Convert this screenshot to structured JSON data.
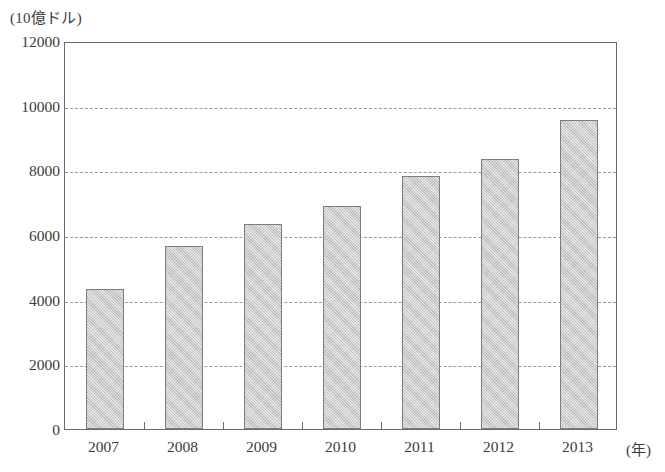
{
  "chart_data": {
    "type": "bar",
    "title": "",
    "subtitle": "",
    "xlabel": "(年)",
    "ylabel": "(10億ドル)",
    "categories": [
      "2007",
      "2008",
      "2009",
      "2010",
      "2011",
      "2012",
      "2013"
    ],
    "values": [
      4330,
      5650,
      6350,
      6900,
      7830,
      8350,
      9550
    ],
    "series": [
      {
        "name": "",
        "values": [
          4330,
          5650,
          6350,
          6900,
          7830,
          8350,
          9550
        ]
      }
    ],
    "ylim": [
      0,
      12000
    ],
    "y_ticks": [
      0,
      2000,
      4000,
      6000,
      8000,
      10000,
      12000
    ],
    "y_tick_labels": [
      "0",
      "2000",
      "4000",
      "6000",
      "8000",
      "10000",
      "12000"
    ],
    "grid": "horizontal-dashed",
    "legend": "none",
    "bar_fill_color": "#c9c9c9",
    "bar_border_color": "#7d7d7d",
    "axis_color": "#6a6a6a",
    "gridline_color": "#9a9a9a",
    "background_color": "#ffffff",
    "text_color": "#3c3c3c"
  }
}
